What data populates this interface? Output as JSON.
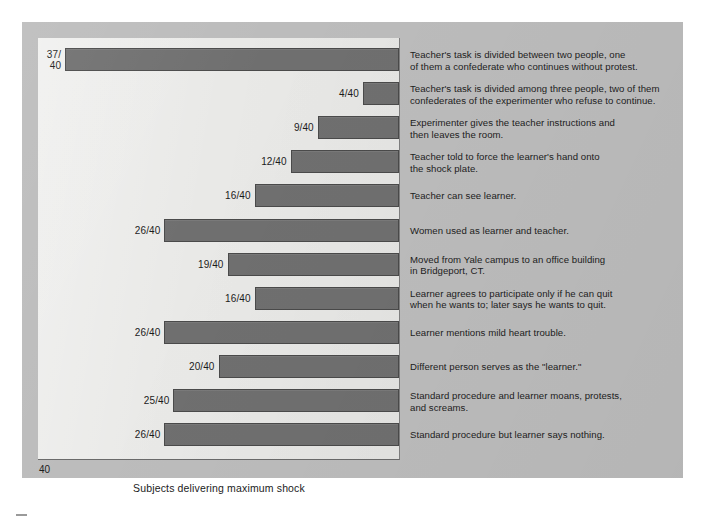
{
  "chart_data": {
    "type": "bar",
    "orientation": "horizontal-right-aligned",
    "title": "",
    "xlabel": "Subjects delivering maximum shock",
    "ylabel": "",
    "axis_origin_label": "40",
    "xlim": [
      0,
      40
    ],
    "grid": false,
    "legend": null,
    "denominator": 40,
    "value_labels": [
      "37/\n40",
      "4/40",
      "9/40",
      "12/40",
      "16/40",
      "26/40",
      "19/40",
      "16/40",
      "26/40",
      "20/40",
      "25/40",
      "26/40"
    ],
    "values": [
      37,
      4,
      9,
      12,
      16,
      26,
      19,
      16,
      26,
      20,
      25,
      26
    ],
    "categories": [
      "Teacher's task is divided between two people, one of them a confederate who continues without protest.",
      "Teacher's task is divided among three people,  two of them confederates of the experimenter who refuse to continue.",
      "Experimenter gives the teacher instructions and then leaves the room.",
      "Teacher told to force the learner's hand onto the shock plate.",
      "Teacher can see learner.",
      "Women used as learner and teacher.",
      "Moved from Yale campus to an office building in Bridgeport, CT.",
      "Learner agrees to participate only if he can quit when he wants to; later says he wants to quit.",
      "Learner mentions mild heart trouble.",
      "Different person serves as the \"learner.\"",
      "Standard procedure and learner moans, protests, and screams.",
      "Standard procedure but learner says nothing."
    ],
    "colors": {
      "bar_fill": "#6f6f6f",
      "bar_border": "#4a4a4a",
      "plot_background": "#e9e9e7",
      "panel_background": "#bcbcbc",
      "page_background": "#ffffff",
      "text": "#1b1b1b"
    }
  },
  "rows": [
    {
      "value_label": "37/\n40",
      "value": 37,
      "description_line_1": "Teacher's task is divided between two people, one",
      "description_line_2": "of them a confederate who continues without protest."
    },
    {
      "value_label": "4/40",
      "value": 4,
      "description_line_1": "Teacher's task is divided among three people,  two of them",
      "description_line_2": "confederates of the experimenter who refuse to continue."
    },
    {
      "value_label": "9/40",
      "value": 9,
      "description_line_1": "Experimenter gives the teacher instructions and",
      "description_line_2": "then leaves the room."
    },
    {
      "value_label": "12/40",
      "value": 12,
      "description_line_1": "Teacher told to force the learner's hand onto",
      "description_line_2": "the shock plate."
    },
    {
      "value_label": "16/40",
      "value": 16,
      "description_line_1": "Teacher can see learner.",
      "description_line_2": ""
    },
    {
      "value_label": "26/40",
      "value": 26,
      "description_line_1": "Women used as learner and teacher.",
      "description_line_2": ""
    },
    {
      "value_label": "19/40",
      "value": 19,
      "description_line_1": "Moved from Yale campus to an office building",
      "description_line_2": "in Bridgeport, CT."
    },
    {
      "value_label": "16/40",
      "value": 16,
      "description_line_1": "Learner agrees to participate only if he can quit",
      "description_line_2": "when he wants to; later says he wants to quit."
    },
    {
      "value_label": "26/40",
      "value": 26,
      "description_line_1": "Learner mentions mild heart trouble.",
      "description_line_2": ""
    },
    {
      "value_label": "20/40",
      "value": 20,
      "description_line_1": "Different person serves as the \"learner.\"",
      "description_line_2": ""
    },
    {
      "value_label": "25/40",
      "value": 25,
      "description_line_1": "Standard procedure and learner moans, protests,",
      "description_line_2": "and screams."
    },
    {
      "value_label": "26/40",
      "value": 26,
      "description_line_1": "Standard procedure but learner says nothing.",
      "description_line_2": ""
    }
  ]
}
